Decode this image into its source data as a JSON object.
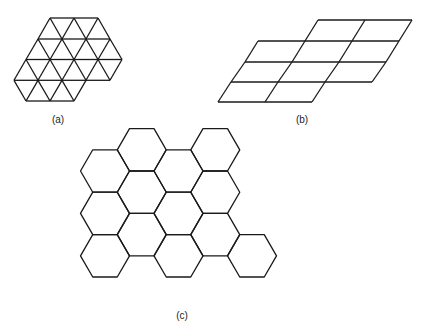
{
  "figure": {
    "panels": [
      {
        "id": "a",
        "label": "(a)",
        "shape": "equilateral triangles",
        "label_pos": [
          58,
          120
        ]
      },
      {
        "id": "b",
        "label": "(b)",
        "shape": "parallelograms",
        "label_pos": [
          302,
          120
        ]
      },
      {
        "id": "c",
        "label": "(c)",
        "shape": "regular hexagons",
        "label_pos": [
          182,
          316
        ]
      }
    ],
    "caption_fragment": ""
  },
  "style": {
    "stroke": "#1a1a1a",
    "background": "#ffffff"
  }
}
